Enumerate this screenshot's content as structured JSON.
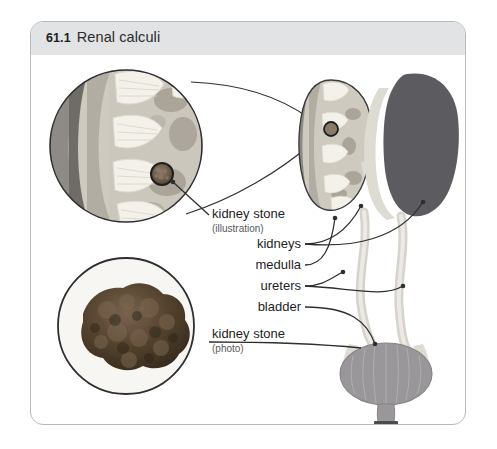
{
  "figure": {
    "number": "61.1",
    "title": "Renal calculi",
    "header_bg": "#e2e3e5",
    "frame_border": "#b9b9bb",
    "background": "#ffffff"
  },
  "labels": [
    {
      "id": "kidney-stone-illustration",
      "text": "kidney stone",
      "sub": "(illustration)"
    },
    {
      "id": "kidneys",
      "text": "kidneys",
      "sub": ""
    },
    {
      "id": "medulla",
      "text": "medulla",
      "sub": ""
    },
    {
      "id": "ureters",
      "text": "ureters",
      "sub": ""
    },
    {
      "id": "bladder",
      "text": "bladder",
      "sub": ""
    },
    {
      "id": "kidney-stone-photo",
      "text": "kidney stone",
      "sub": "(photo)"
    }
  ],
  "illustration": {
    "magnified_kidney_section": "circular magnified cross-section of kidney showing cortex, medulla, renal pyramids and a calculus",
    "small_kidney_section": "small kidney cross-section with highlighted calculus",
    "whole_kidney": "solid silhouette of intact kidney",
    "ureters": "paired wavy tubes descending from kidneys to bladder",
    "bladder": "oval bladder with vertical muscle striations and urethra",
    "stone_photo": "photograph of an irregular brown kidney stone in a circular frame"
  },
  "colors": {
    "cortex": "#c9c4bb",
    "capsule": "#8e8b86",
    "medulla_band": "#a9a49c",
    "pyramid": "#f2efe8",
    "stone_dark": "#6d5f52",
    "kidney_solid": "#5b5b60",
    "tube_pale": "#cfcdc8",
    "bladder_fill": "#9a979a",
    "leader_line": "#2e2e30"
  }
}
